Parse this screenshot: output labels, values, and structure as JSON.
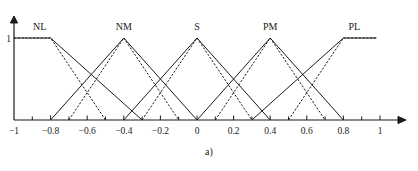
{
  "figure": {
    "caption": "a)",
    "y_axis_label": "1"
  },
  "chart_data": {
    "type": "line",
    "title": "",
    "xlabel": "",
    "ylabel": "",
    "xlim": [
      -1,
      1
    ],
    "ylim": [
      0,
      1
    ],
    "grid": false,
    "legend": "inline-labels-above-peaks",
    "x_ticks": [
      -1,
      -0.8,
      -0.6,
      -0.4,
      -0.2,
      0,
      0.2,
      0.4,
      0.6,
      0.8,
      1
    ],
    "x_tick_labels": [
      "−1",
      "−0.8",
      "−0.6",
      "−0.4",
      "−0.2",
      "0",
      "0.2",
      "0.4",
      "0.6",
      "0.8",
      "1"
    ],
    "x_minor_ticks": [
      -0.9,
      -0.7,
      -0.5,
      -0.3,
      -0.1,
      0.1,
      0.3,
      0.5,
      0.7,
      0.9
    ],
    "y_ticks": [
      1
    ],
    "y_tick_labels": [
      "1"
    ],
    "set_labels": [
      {
        "name": "NL",
        "x": -0.86,
        "label_x": -0.86
      },
      {
        "name": "NM",
        "x": -0.4,
        "label_x": -0.4
      },
      {
        "name": "S",
        "x": 0.0,
        "label_x": 0.0
      },
      {
        "name": "PM",
        "x": 0.4,
        "label_x": 0.4
      },
      {
        "name": "PL",
        "x": 0.86,
        "label_x": 0.86
      }
    ],
    "series": [
      {
        "name": "NL-wide",
        "style": "solid",
        "points": [
          [
            -1,
            1
          ],
          [
            -0.8,
            1
          ],
          [
            -0.3,
            0
          ]
        ]
      },
      {
        "name": "NL-narrow",
        "style": "dashed",
        "points": [
          [
            -1,
            1
          ],
          [
            -0.8,
            1
          ],
          [
            -0.5,
            0
          ]
        ]
      },
      {
        "name": "NM-wide",
        "style": "solid",
        "points": [
          [
            -0.8,
            0
          ],
          [
            -0.4,
            1
          ],
          [
            0.0,
            0
          ]
        ]
      },
      {
        "name": "NM-narrow",
        "style": "dashed",
        "points": [
          [
            -0.7,
            0
          ],
          [
            -0.4,
            1
          ],
          [
            -0.1,
            0
          ]
        ]
      },
      {
        "name": "S-wide",
        "style": "solid",
        "points": [
          [
            -0.4,
            0
          ],
          [
            0.0,
            1
          ],
          [
            0.4,
            0
          ]
        ]
      },
      {
        "name": "S-narrow",
        "style": "dashed",
        "points": [
          [
            -0.3,
            0
          ],
          [
            0.0,
            1
          ],
          [
            0.3,
            0
          ]
        ]
      },
      {
        "name": "PM-wide",
        "style": "solid",
        "points": [
          [
            0.0,
            0
          ],
          [
            0.4,
            1
          ],
          [
            0.8,
            0
          ]
        ]
      },
      {
        "name": "PM-narrow",
        "style": "dashed",
        "points": [
          [
            0.1,
            0
          ],
          [
            0.4,
            1
          ],
          [
            0.7,
            0
          ]
        ]
      },
      {
        "name": "PL-wide",
        "style": "solid",
        "points": [
          [
            0.3,
            0
          ],
          [
            0.8,
            1
          ],
          [
            0.98,
            1
          ]
        ]
      },
      {
        "name": "PL-narrow",
        "style": "dashed",
        "points": [
          [
            0.5,
            0
          ],
          [
            0.8,
            1
          ],
          [
            0.98,
            1
          ]
        ]
      }
    ],
    "colors": {
      "line": "#1a1a1a",
      "axis": "#1a1a1a",
      "background": "#ffffff"
    }
  }
}
